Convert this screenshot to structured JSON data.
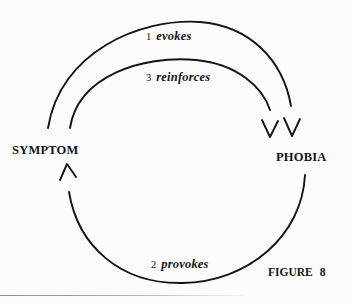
{
  "figure": {
    "caption_word": "FIGURE",
    "caption_number": "8",
    "nodes": [
      {
        "id": "symptom",
        "label": "SYMPTOM"
      },
      {
        "id": "phobia",
        "label": "PHOBIA"
      }
    ],
    "arcs": [
      {
        "id": "evokes",
        "step": "1",
        "verb": "evokes",
        "from": "SYMPTOM",
        "to": "PHOBIA",
        "position": "outer-top"
      },
      {
        "id": "reinforces",
        "step": "3",
        "verb": "reinforces",
        "from": "SYMPTOM",
        "to": "PHOBIA",
        "position": "inner-top"
      },
      {
        "id": "provokes",
        "step": "2",
        "verb": "provokes",
        "from": "PHOBIA",
        "to": "SYMPTOM",
        "position": "bottom"
      }
    ],
    "colors": {
      "ink": "#141414",
      "background": "#fcfcfc",
      "rule": "#8d8d8d"
    }
  }
}
